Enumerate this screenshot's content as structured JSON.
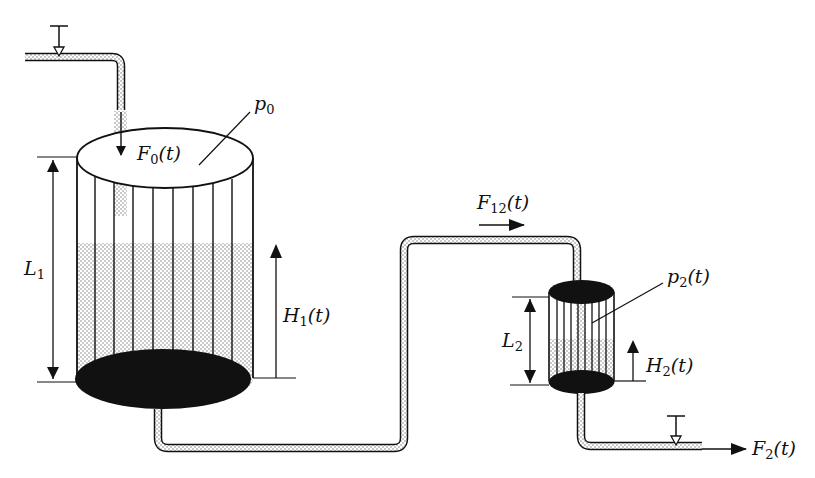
{
  "colors": {
    "ink": "#111111",
    "liquid_dot": "#8a8a8a",
    "background": "#ffffff"
  },
  "labels": {
    "p0": {
      "base": "p",
      "sub": "0",
      "rest": ""
    },
    "F0": {
      "base": "F",
      "sub": "0",
      "rest": "(t)"
    },
    "L1": {
      "base": "L",
      "sub": "1",
      "rest": ""
    },
    "H1": {
      "base": "H",
      "sub": "1",
      "rest": "(t)"
    },
    "F12": {
      "base": "F",
      "sub": "12",
      "rest": "(t)"
    },
    "p2": {
      "base": "p",
      "sub": "2",
      "rest": "(t)"
    },
    "L2": {
      "base": "L",
      "sub": "2",
      "rest": ""
    },
    "H2": {
      "base": "H",
      "sub": "2",
      "rest": "(t)"
    },
    "F2": {
      "base": "F",
      "sub": "2",
      "rest": "(t)"
    }
  },
  "components": {
    "tank1": {
      "name": "Tank 1",
      "level_label": "H1(t)",
      "height_label": "L1",
      "pressure_label": "p0"
    },
    "tank2": {
      "name": "Tank 2",
      "level_label": "H2(t)",
      "height_label": "L2",
      "pressure_label": "p2(t)"
    },
    "inlet_valve": {
      "name": "Inlet valve"
    },
    "outlet_valve": {
      "name": "Outlet valve"
    }
  }
}
